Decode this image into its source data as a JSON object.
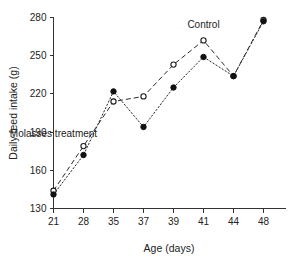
{
  "chart_data": {
    "type": "line",
    "title": "",
    "xlabel": "Age (days)",
    "ylabel": "Daily feed intake (g)",
    "x": [
      21,
      28,
      35,
      37,
      39,
      41,
      44,
      48
    ],
    "xticklabels": [
      "21",
      "28",
      "35",
      "37",
      "39",
      "41",
      "44",
      "48"
    ],
    "yticklabels": [
      "130",
      "160",
      "190",
      "220",
      "250",
      "280"
    ],
    "yticks": [
      130,
      160,
      190,
      220,
      250,
      280
    ],
    "ylim": [
      130,
      280
    ],
    "grid": false,
    "legend": "inline-annotations",
    "series": [
      {
        "name": "Control",
        "marker": "open-circle",
        "linestyle": "dashed",
        "values": [
          144,
          179,
          214,
          218,
          243,
          262,
          234,
          278
        ]
      },
      {
        "name": "Molasses treatment",
        "marker": "filled-circle",
        "linestyle": "dotted",
        "values": [
          141,
          172,
          222,
          194,
          225,
          249,
          234,
          277
        ]
      }
    ],
    "annotations": [
      {
        "text": "Control",
        "x": 41,
        "y": 272
      },
      {
        "text": "Molasses treatment",
        "x": 38,
        "y": 186
      }
    ]
  },
  "colors": {
    "line": "#2a2a2a",
    "axis": "#333333",
    "text": "#222222",
    "background": "#ffffff"
  }
}
